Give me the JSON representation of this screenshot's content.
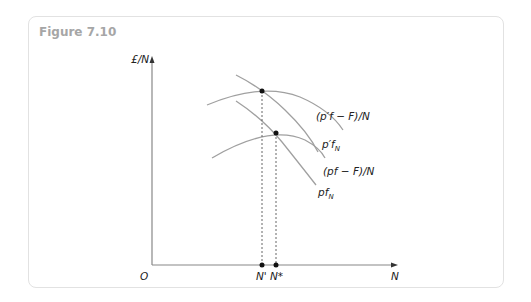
{
  "figure": {
    "title": "Figure 7.10",
    "y_axis_label": "£/N",
    "x_axis_label": "N",
    "origin_label": "O",
    "x_ticks": [
      "N'",
      "N*"
    ],
    "curves": [
      {
        "id": "pprime_f_minus_F_over_N",
        "label": "(p′f − F)/N"
      },
      {
        "id": "pprime_fN",
        "label": "p′f",
        "subscript": "N"
      },
      {
        "id": "pf_minus_F_over_N",
        "label": "(pf − F)/N"
      },
      {
        "id": "pfN",
        "label": "pf",
        "subscript": "N"
      }
    ],
    "colors": {
      "curve": "#a0a0a0",
      "axis": "#888888",
      "text": "#222222",
      "title": "#a6a6a6",
      "frame": "#e2e2e2"
    }
  }
}
